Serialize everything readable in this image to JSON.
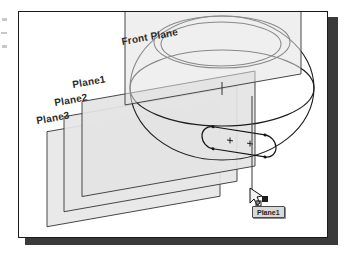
{
  "figure": {
    "frame": {
      "border_color": "#1b1b1b",
      "page_color": "#ffffff",
      "shadow_color": "#3a3a3a"
    }
  },
  "planes": [
    {
      "id": "front-plane",
      "label": "Front Plane",
      "fill": "#e6e6e6",
      "stroke": "#3c3c3c"
    },
    {
      "id": "plane-1",
      "label": "Plane1",
      "fill": "#e6e6e6",
      "stroke": "#3c3c3c"
    },
    {
      "id": "plane-2",
      "label": "Plane2",
      "fill": "#e6e6e6",
      "stroke": "#3c3c3c"
    },
    {
      "id": "plane-3",
      "label": "Plane3",
      "fill": "#e6e6e6",
      "stroke": "#3c3c3c"
    }
  ],
  "model": {
    "body": "ellipsoid",
    "body_stroke": "#1e1e1e",
    "rim_ellipses": 2,
    "sketch": {
      "type": "slot",
      "center_marks": [
        "+",
        "+"
      ],
      "stroke": "#141414"
    }
  },
  "cursor": {
    "icon": "arrow-cursor-icon",
    "badge": "create-plane-badge-icon"
  },
  "tooltip": {
    "label": "Plane1",
    "background": "#d9d9d9",
    "border": "#4a4a4a"
  },
  "leader": {
    "stroke": "#4a4a4a"
  }
}
